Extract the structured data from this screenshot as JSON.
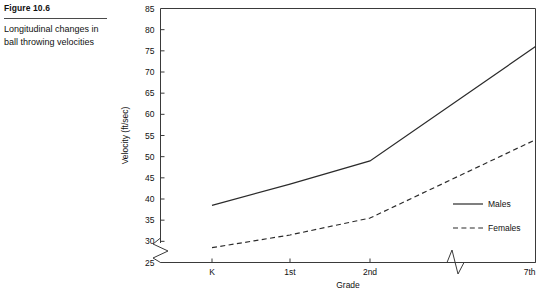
{
  "figure": {
    "number_label": "Figure 10.6",
    "caption": "Longitudinal changes in ball throwing velocities"
  },
  "chart_data": {
    "type": "line",
    "title": "",
    "xlabel": "Grade",
    "ylabel": "Velocity (ft/sec)",
    "categories": [
      "K",
      "1st",
      "2nd",
      "7th"
    ],
    "ylim": [
      25,
      85
    ],
    "yticks": [
      25,
      30,
      35,
      40,
      45,
      50,
      55,
      60,
      65,
      70,
      75,
      80,
      85
    ],
    "ytick_labels": [
      "25",
      "30",
      "35",
      "40",
      "45",
      "50",
      "55",
      "60",
      "65",
      "70",
      "75",
      "80",
      "85"
    ],
    "grid": false,
    "y_axis_break": true,
    "x_axis_break": true,
    "x_axis_break_between": [
      "2nd",
      "7th"
    ],
    "legend_position": "inside-bottom-right",
    "series": [
      {
        "name": "Males",
        "style": "solid",
        "color": "#2b2b2b",
        "values": [
          38.5,
          43.5,
          49.0,
          76.0
        ]
      },
      {
        "name": "Females",
        "style": "dashed",
        "color": "#2b2b2b",
        "values": [
          28.5,
          31.5,
          35.5,
          54.0
        ]
      }
    ],
    "legend": [
      {
        "label": "Males",
        "style": "solid"
      },
      {
        "label": "Females",
        "style": "dashed"
      }
    ]
  }
}
